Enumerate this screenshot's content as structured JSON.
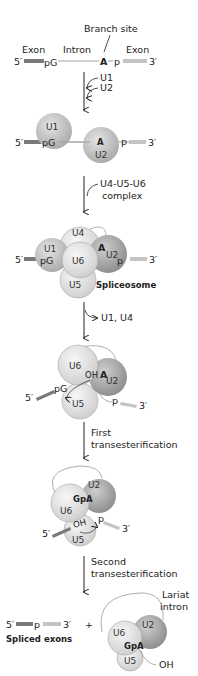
{
  "stage1": {
    "branch_site": "Branch site",
    "exon_left": "Exon",
    "intron": "Intron",
    "exon_right": "Exon",
    "five_prime": "5′",
    "three_prime": "3′",
    "pG": "pG",
    "A": "A",
    "p": "p"
  },
  "step1": {
    "lines": [
      "U1",
      "U2"
    ]
  },
  "stage2": {
    "five_prime": "5′",
    "three_prime": "3′",
    "U1": "U1",
    "U2": "U2",
    "pG": "pG",
    "A": "A",
    "p": "p"
  },
  "step2": {
    "lines": [
      "U4-U5-U6",
      "complex"
    ]
  },
  "stage3": {
    "five_prime": "5′",
    "three_prime": "3′",
    "U1": "U1",
    "U2": "U2",
    "U4": "U4",
    "U5": "U5",
    "U6": "U6",
    "pG": "pG",
    "A": "A",
    "p": "p",
    "label": "Spliceosome"
  },
  "step3": {
    "label": "U1, U4"
  },
  "stage4": {
    "five_prime": "5′",
    "three_prime": "3′",
    "U6": "U6",
    "U2": "U2",
    "U5": "U5",
    "OH": "OH",
    "A": "A",
    "pG": "pG",
    "p": "p"
  },
  "step4": {
    "lines": [
      "First",
      "transesterification"
    ]
  },
  "stage5": {
    "five_prime": "5′",
    "three_prime": "3′",
    "U2": "U2",
    "U6": "U6",
    "U5": "U5",
    "GpA": "GpA",
    "OH": "OH",
    "p": "p"
  },
  "step5": {
    "lines": [
      "Second",
      "transesterification"
    ]
  },
  "stage6": {
    "spliced": {
      "five_prime": "5′",
      "p": "p",
      "three_prime": "3′",
      "label": "Spliced exons"
    },
    "plus": "+",
    "lariat": {
      "lines": [
        "Lariat",
        "intron"
      ],
      "U6": "U6",
      "U2": "U2",
      "U5": "U5",
      "GpA": "GpA",
      "OH": "OH"
    }
  },
  "colors": {
    "exon_5": "#7a7a7a",
    "exon_3": "#c4c4c4",
    "intron": "#a0a0a0",
    "snrnp_light": "#e6e6e6",
    "snrnp_mid": "#cfcfcf",
    "snrnp_dark": "#a9a9a9",
    "arrow": "#222222"
  }
}
